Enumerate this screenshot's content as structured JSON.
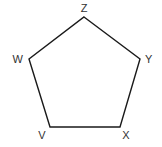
{
  "diagram": {
    "type": "pentagon",
    "stroke_color": "#1a1a1a",
    "label_color": "#333333",
    "background": "#ffffff",
    "vertices": [
      {
        "name": "Z",
        "x": 84,
        "y": 17,
        "label_x": 84,
        "label_y": 12,
        "anchor": "middle"
      },
      {
        "name": "Y",
        "x": 140,
        "y": 59,
        "label_x": 145,
        "label_y": 63,
        "anchor": "start"
      },
      {
        "name": "X",
        "x": 120,
        "y": 127,
        "label_x": 126,
        "label_y": 139,
        "anchor": "middle"
      },
      {
        "name": "V",
        "x": 50,
        "y": 127,
        "label_x": 42,
        "label_y": 139,
        "anchor": "middle"
      },
      {
        "name": "W",
        "x": 29,
        "y": 59,
        "label_x": 23,
        "label_y": 63,
        "anchor": "end"
      }
    ],
    "edges": [
      [
        "Z",
        "Y"
      ],
      [
        "Y",
        "X"
      ],
      [
        "X",
        "V"
      ],
      [
        "V",
        "W"
      ],
      [
        "W",
        "Z"
      ]
    ]
  },
  "labels": {
    "z": "Z",
    "y": "Y",
    "x": "X",
    "v": "V",
    "w": "W"
  }
}
